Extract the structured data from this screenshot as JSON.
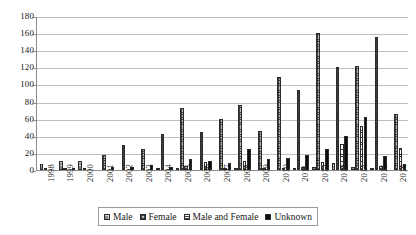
{
  "chart_data": {
    "type": "bar",
    "title": "",
    "subtitle": "",
    "xlabel": "",
    "ylabel": "",
    "ylim": [
      0,
      180
    ],
    "yticks": [
      0,
      20,
      40,
      60,
      80,
      100,
      120,
      140,
      160,
      180
    ],
    "ytick_labels": [
      "0",
      "20",
      "40",
      "60",
      "80",
      "100",
      "120",
      "140",
      "160",
      "180"
    ],
    "grid": true,
    "legend_position": "bottom",
    "categories": [
      "1998",
      "1999",
      "2000",
      "2001",
      "2002",
      "2003",
      "2004",
      "2005",
      "2006",
      "2007",
      "2008",
      "2009",
      "2010",
      "2011",
      "2012",
      "2013",
      "2014",
      "2015",
      "2016"
    ],
    "series": [
      {
        "name": "Male",
        "pattern": "checker-grey",
        "color": "#8a8a8a",
        "values": [
          7,
          11,
          11,
          0,
          0,
          0,
          1,
          1,
          0,
          0,
          2,
          0,
          0,
          1,
          4,
          8,
          3,
          2,
          0
        ]
      },
      {
        "name": "Female",
        "pattern": "checker-dark",
        "color": "#b8b8b8",
        "values": [
          1,
          1,
          2,
          18,
          29,
          24,
          42,
          72,
          45,
          60,
          76,
          46,
          109,
          93,
          160,
          120,
          121,
          156,
          66
        ]
      },
      {
        "name": "Male and Female",
        "pattern": "horizontal-lines",
        "color": "#ffffff",
        "values": [
          0,
          0,
          0,
          0,
          0,
          0,
          0,
          5,
          9,
          1,
          10,
          1,
          1,
          4,
          9,
          30,
          51,
          5,
          26
        ]
      },
      {
        "name": "Unknown",
        "pattern": "solid-black",
        "color": "#0d0d0d",
        "values": [
          0,
          1,
          0,
          4,
          4,
          6,
          4,
          13,
          11,
          8,
          24,
          13,
          14,
          17,
          25,
          40,
          62,
          16,
          7
        ]
      }
    ]
  },
  "legend": {
    "items": [
      {
        "label": "Male",
        "swatch_class": "s-male"
      },
      {
        "label": "Female",
        "swatch_class": "s-female"
      },
      {
        "label": "Male and Female",
        "swatch_class": "s-mf"
      },
      {
        "label": "Unknown",
        "swatch_class": "s-unknown"
      }
    ]
  }
}
